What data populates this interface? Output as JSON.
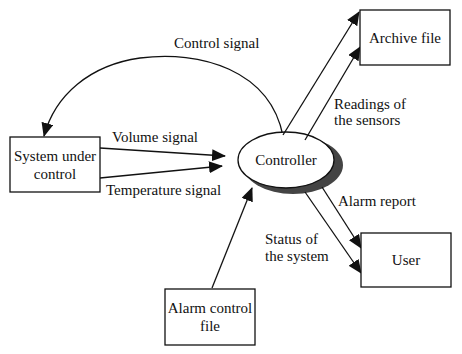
{
  "diagram": {
    "type": "data-flow context diagram",
    "nodes": {
      "system": {
        "line1": "System under",
        "line2": "control"
      },
      "controller": {
        "label": "Controller"
      },
      "archive": {
        "label": "Archive file"
      },
      "user": {
        "label": "User"
      },
      "alarm_file": {
        "line1": "Alarm control",
        "line2": "file"
      }
    },
    "flows": {
      "control_signal": "Control signal",
      "volume_signal": "Volume signal",
      "temperature_signal": "Temperature signal",
      "readings": {
        "line1": "Readings of",
        "line2": "the sensors"
      },
      "alarm_report": "Alarm report",
      "status": {
        "line1": "Status of",
        "line2": "the system"
      }
    },
    "colors": {
      "stroke": "#111111",
      "shadow": "#444444",
      "background": "#ffffff"
    }
  }
}
